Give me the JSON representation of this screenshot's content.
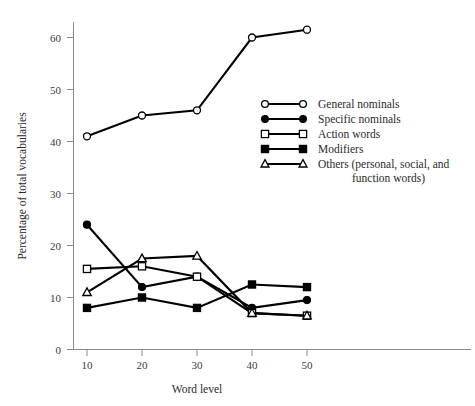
{
  "chart_data": {
    "type": "line",
    "title": "",
    "xlabel": "Word level",
    "ylabel": "Percentage of total vocabularies",
    "x": [
      10,
      20,
      30,
      40,
      50
    ],
    "xtick_labels": [
      "10",
      "20",
      "30",
      "40",
      "50"
    ],
    "ytick_labels": [
      "0",
      "10",
      "20",
      "30",
      "40",
      "50",
      "60"
    ],
    "yticks": [
      0,
      10,
      20,
      30,
      40,
      50,
      60
    ],
    "xlim": [
      5,
      55
    ],
    "ylim": [
      0,
      65
    ],
    "grid": false,
    "legend_position": "center-right",
    "series": [
      {
        "name": "General nominals",
        "marker": "open-circle",
        "values": [
          41,
          45,
          46,
          60,
          61.5
        ]
      },
      {
        "name": "Specific nominals",
        "marker": "filled-circle",
        "values": [
          24,
          12,
          14,
          8,
          9.5
        ]
      },
      {
        "name": "Action words",
        "marker": "open-square",
        "values": [
          15.5,
          16,
          14,
          7,
          6.5
        ]
      },
      {
        "name": "Modifiers",
        "marker": "filled-square",
        "values": [
          8,
          10,
          8,
          12.5,
          12
        ]
      },
      {
        "name": "Others (personal, social, and function words)",
        "marker": "open-triangle",
        "values": [
          11,
          17.5,
          18,
          7,
          6.5
        ]
      }
    ]
  },
  "legend": {
    "entries": [
      {
        "label": "General nominals",
        "label2": ""
      },
      {
        "label": "Specific nominals",
        "label2": ""
      },
      {
        "label": "Action words",
        "label2": ""
      },
      {
        "label": "Modifiers",
        "label2": ""
      },
      {
        "label": "Others (personal, social, and",
        "label2": "function words)"
      }
    ]
  },
  "colors": {
    "line": "#000000",
    "axis": "#8a8a8a",
    "text": "#2a2a2a",
    "background": "#ffffff"
  }
}
